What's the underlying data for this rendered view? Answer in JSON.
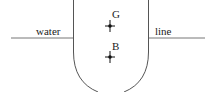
{
  "diagram": {
    "waterline_left_label": "water",
    "waterline_right_label": "line",
    "points": [
      {
        "label": "G",
        "meaning": "centre of gravity",
        "x": 110,
        "y": 26
      },
      {
        "label": "B",
        "meaning": "centre of buoyancy",
        "x": 110,
        "y": 57
      }
    ],
    "colors": {
      "stroke": "#555555",
      "text": "#222222",
      "point": "#111111"
    }
  }
}
